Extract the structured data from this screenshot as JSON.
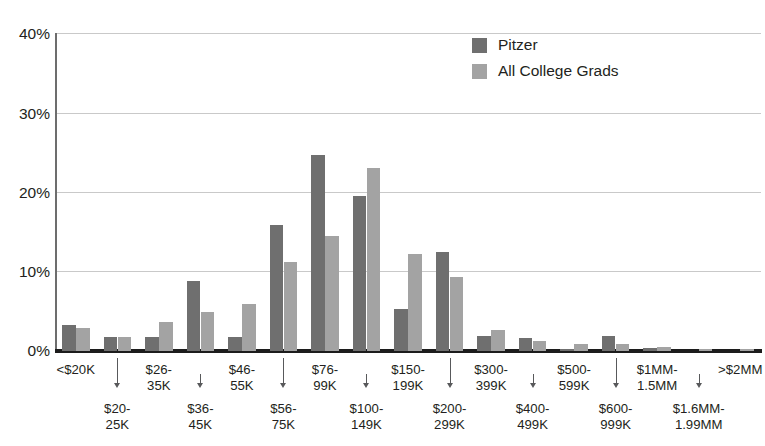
{
  "chart_data": {
    "type": "bar",
    "title": "",
    "subtitle": "",
    "xlabel": "",
    "ylabel": "",
    "ylim": [
      0,
      40
    ],
    "y_ticks": [
      0,
      10,
      20,
      30,
      40
    ],
    "y_tick_labels": [
      "0%",
      "10%",
      "20%",
      "30%",
      "40%"
    ],
    "grid": "horizontal",
    "legend_position": "top-right",
    "value_unit": "%",
    "categories": [
      "<$20K",
      "$20-\n25K",
      "$26-\n35K",
      "$36-\n45K",
      "$46-\n55K",
      "$56-\n75K",
      "$76-\n99K",
      "$100-\n149K",
      "$150-\n199K",
      "$200-\n299K",
      "$300-\n399K",
      "$400-\n499K",
      "$500-\n599K",
      "$600-\n999K",
      "$1MM-\n1.5MM",
      "$1.6MM-\n1.99MM",
      ">$2MM"
    ],
    "category_label_rows": [
      "top",
      "bottom",
      "top",
      "bottom",
      "top",
      "bottom",
      "top",
      "bottom",
      "top",
      "bottom",
      "top",
      "bottom",
      "top",
      "bottom",
      "top",
      "bottom",
      "top"
    ],
    "series": [
      {
        "name": "Pitzer",
        "color": "#6f6f6f",
        "values": [
          3.3,
          1.8,
          1.8,
          8.8,
          1.8,
          15.9,
          24.6,
          19.5,
          5.3,
          12.4,
          1.9,
          1.7,
          0.3,
          1.9,
          0.4,
          0.0,
          0.0
        ]
      },
      {
        "name": "All College Grads",
        "color": "#a3a3a3",
        "values": [
          2.9,
          1.8,
          3.6,
          4.9,
          5.9,
          11.2,
          14.5,
          23.0,
          12.2,
          9.3,
          2.7,
          1.3,
          0.9,
          0.9,
          0.5,
          0.2,
          0.2
        ]
      }
    ]
  },
  "legend": {
    "items": [
      {
        "label": "Pitzer",
        "color": "#6f6f6f"
      },
      {
        "label": "All College Grads",
        "color": "#a3a3a3"
      }
    ]
  },
  "axis": {
    "y_tick_labels": [
      "40%",
      "30%",
      "20%",
      "10%",
      "0%"
    ]
  }
}
